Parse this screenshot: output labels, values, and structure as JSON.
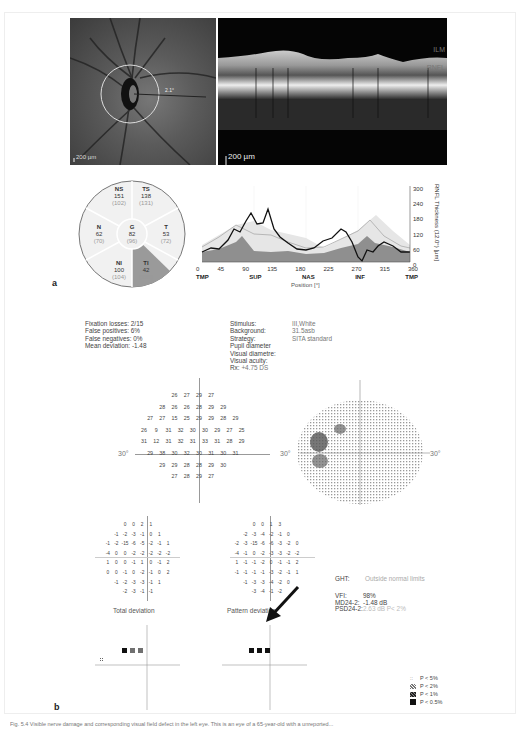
{
  "panel_a": {
    "letter": "a",
    "fundus_scale": "200 µm",
    "fundus_circle_label": "2.1°",
    "oct_scale": "200 µm",
    "oct_layers": [
      "ILM",
      "RNFL"
    ],
    "sectors": [
      {
        "id": "NS",
        "value": "151",
        "normal": "(102)"
      },
      {
        "id": "TS",
        "value": "138",
        "normal": "(131)"
      },
      {
        "id": "N",
        "value": "62",
        "normal": "(70)"
      },
      {
        "id": "G",
        "value": "82",
        "normal": "(96)"
      },
      {
        "id": "T",
        "value": "53",
        "normal": "(72)"
      },
      {
        "id": "NI",
        "value": "100",
        "normal": "(104)"
      },
      {
        "id": "TI",
        "value": "42",
        "normal": "(131)"
      }
    ]
  },
  "chart_data": {
    "type": "line",
    "title": "",
    "xlabel": "Position [°]",
    "ylabel": "RNFL Thickness (12.0°) [µm]",
    "x_ticks": [
      0,
      45,
      90,
      135,
      180,
      225,
      270,
      315,
      360
    ],
    "x_region_labels": [
      "TMP",
      "SUP",
      "NAS",
      "INF",
      "TMP"
    ],
    "y_ticks": [
      0,
      60,
      120,
      180,
      240,
      300
    ],
    "ylim": [
      0,
      300
    ],
    "xlim": [
      0,
      360
    ],
    "grid": true,
    "series": [
      {
        "name": "Patient RNFL",
        "color": "#111111",
        "x": [
          0,
          15,
          30,
          45,
          55,
          65,
          75,
          85,
          95,
          105,
          115,
          125,
          135,
          150,
          165,
          180,
          195,
          210,
          225,
          240,
          250,
          260,
          270,
          278,
          285,
          295,
          305,
          315,
          330,
          345,
          360
        ],
        "values": [
          40,
          55,
          50,
          85,
          130,
          120,
          160,
          190,
          150,
          155,
          205,
          130,
          100,
          75,
          50,
          45,
          55,
          80,
          90,
          130,
          120,
          80,
          20,
          5,
          45,
          40,
          60,
          75,
          60,
          40,
          40
        ]
      },
      {
        "name": "Normal mean",
        "color": "#aaaaaa",
        "x": [
          0,
          30,
          60,
          90,
          120,
          150,
          180,
          210,
          240,
          270,
          290,
          315,
          345,
          360
        ],
        "values": [
          60,
          100,
          145,
          110,
          105,
          80,
          55,
          60,
          90,
          120,
          160,
          100,
          60,
          55
        ]
      },
      {
        "name": "Lower normal limit (shaded)",
        "color": "#888888",
        "x": [
          0,
          30,
          60,
          70,
          90,
          120,
          150,
          180,
          210,
          240,
          270,
          285,
          300,
          330,
          360
        ],
        "values": [
          40,
          50,
          80,
          90,
          45,
          40,
          45,
          30,
          35,
          55,
          70,
          100,
          60,
          55,
          40
        ]
      }
    ]
  },
  "panel_b": {
    "letter": "b",
    "reliability": [
      "Fixation losses: 2/15",
      "False positives: 6%",
      "False negatives: 0%",
      "Mean deviation: -1.48"
    ],
    "test_params": [
      {
        "label": "Stimulus:",
        "value": "III,White"
      },
      {
        "label": "Background:",
        "value": "31.5asb"
      },
      {
        "label": "Strategy:",
        "value": "SITA standard"
      },
      {
        "label": "Pupil diameter",
        "value": ""
      },
      {
        "label": "Visual diametre:",
        "value": ""
      },
      {
        "label": "Visual acuity:",
        "value": ""
      },
      {
        "label": "Rx:",
        "value": "+4.75 DS"
      }
    ],
    "axis_label": "30°",
    "threshold_rows": [
      [
        "26",
        "27",
        "29",
        "27"
      ],
      [
        "28",
        "26",
        "26",
        "28",
        "29",
        "29"
      ],
      [
        "27",
        "27",
        "15",
        "25",
        "29",
        "29",
        "28",
        "29"
      ],
      [
        "26",
        "9",
        "31",
        "32",
        "30",
        "30",
        "29",
        "27",
        "25"
      ],
      [
        "31",
        "12",
        "31",
        "32",
        "31",
        "33",
        "31",
        "28",
        "29"
      ],
      [
        "29",
        "38",
        "30",
        "32",
        "30",
        "31",
        "30",
        "31"
      ],
      [
        "29",
        "29",
        "28",
        "28",
        "29",
        "30"
      ],
      [
        "27",
        "28",
        "29",
        "27"
      ]
    ],
    "total_deviation_rows": [
      [
        "0",
        "0",
        "2",
        "1"
      ],
      [
        "-1",
        "-2",
        "-3",
        "-1",
        "0",
        "1"
      ],
      [
        "-1",
        "-2",
        "-15",
        "-6",
        "-5",
        "-2",
        "-1",
        "1"
      ],
      [
        "-4",
        "0",
        "0",
        "-2",
        "-2",
        "-2",
        "-2",
        "-2"
      ],
      [
        "1",
        "0",
        "0",
        "-1",
        "1",
        "0",
        "-1",
        "2"
      ],
      [
        "0",
        "0",
        "-1",
        "0",
        "-2",
        "-1",
        "0",
        "2"
      ],
      [
        "-1",
        "-2",
        "-3",
        "-3",
        "-1",
        "1"
      ],
      [
        "-2",
        "-3",
        "-1",
        "-1"
      ]
    ],
    "pattern_deviation_rows": [
      [
        "0",
        "0",
        "1",
        "3"
      ],
      [
        "-2",
        "-3",
        "-4",
        "-2",
        "-1",
        "0"
      ],
      [
        "-2",
        "-3",
        "-15",
        "-6",
        "-6",
        "-3",
        "-2",
        "0"
      ],
      [
        "-4",
        "-1",
        "0",
        "-2",
        "-3",
        "-3",
        "-2",
        "-2"
      ],
      [
        "1",
        "-1",
        "-1",
        "-2",
        "0",
        "-1",
        "-1",
        "2"
      ],
      [
        "-1",
        "-1",
        "-1",
        "-1",
        "-3",
        "-2",
        "-1",
        "1"
      ],
      [
        "-1",
        "-3",
        "-3",
        "-4",
        "-2",
        "0"
      ],
      [
        "-3",
        "-4",
        "-1",
        "-2"
      ]
    ],
    "total_deviation_label": "Total deviation",
    "pattern_deviation_label": "Pattern deviation",
    "ght": {
      "label": "GHT:",
      "value": "Outside normal limits"
    },
    "indices": [
      {
        "label": "VFI:",
        "value": "98%"
      },
      {
        "label": "MD24-2:",
        "value": "-1.48 dB"
      },
      {
        "label": "PSD24-2:",
        "value": "2.63 dB P< 2%"
      }
    ],
    "legend": [
      {
        "symbol": "dots4",
        "label": "P < 5%"
      },
      {
        "symbol": "hatch-light",
        "label": "P < 2%"
      },
      {
        "symbol": "hatch-dark",
        "label": "P < 1%"
      },
      {
        "symbol": "solid",
        "label": "P < 0.5%"
      }
    ]
  },
  "caption": "Fig. 5.4 Visible nerve damage and corresponding visual field defect in the left eye. This is an eye of a 65-year-old with a unreported..."
}
